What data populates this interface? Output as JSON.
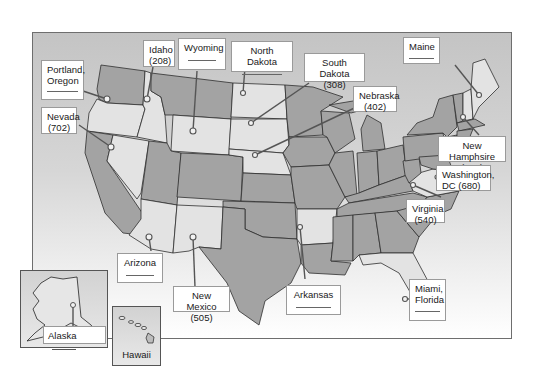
{
  "figure": {
    "colors": {
      "dark_state": "#a3a3a3",
      "light_state": "#e3e3e3",
      "frame_border": "#6e6e6e",
      "label_bg": "#ffffff"
    }
  },
  "labels": {
    "portland": {
      "line1": "Portland,",
      "line2": "Oregon",
      "value": ""
    },
    "idaho": {
      "line1": "Idaho",
      "line2": "(208)"
    },
    "wyoming": {
      "line1": "Wyoming",
      "value": ""
    },
    "north_dakota": {
      "line1": "North Dakota",
      "value": ""
    },
    "south_dakota": {
      "line1": "South Dakota",
      "line2": "(308)"
    },
    "nebraska": {
      "line1": "Nebraska",
      "line2": "(402)"
    },
    "maine": {
      "line1": "Maine",
      "value": ""
    },
    "nevada": {
      "line1": "Nevada",
      "line2": "(702)"
    },
    "new_hampshire": {
      "line1": "New Hamphsire",
      "line2": "(603)"
    },
    "washington_dc": {
      "line1": "Washington,",
      "line2": "DC (680)"
    },
    "virginia": {
      "line1": "Virginia",
      "line2": "(540)"
    },
    "arizona": {
      "line1": "Arizona",
      "value": ""
    },
    "new_mexico": {
      "line1": "New Mexico",
      "line2": "(505)"
    },
    "arkansas": {
      "line1": "Arkansas",
      "value": ""
    },
    "miami": {
      "line1": "Miami,",
      "line2": "Florida",
      "value": ""
    },
    "alaska": {
      "line1": "Alaska",
      "value": ""
    },
    "hawaii": {
      "line1": "Hawaii"
    }
  }
}
